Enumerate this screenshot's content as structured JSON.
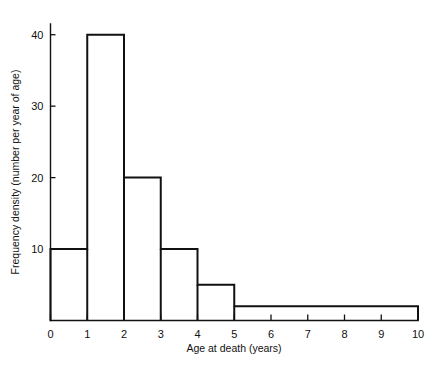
{
  "figure": {
    "title": "",
    "background_color": "#ffffff",
    "line_color": "#111111"
  },
  "axes": {
    "x": {
      "label": "Age at death (years)",
      "ticks": [
        "0",
        "1",
        "2",
        "3",
        "4",
        "5",
        "6",
        "7",
        "8",
        "9",
        "10"
      ],
      "min": 0,
      "max": 10
    },
    "y": {
      "label": "Frequency density (number per year of age)",
      "ticks": [
        "10",
        "20",
        "30",
        "40"
      ],
      "min": 0,
      "max": 41.5
    }
  },
  "chart_data": {
    "type": "bar",
    "title": "",
    "xlabel": "Age at death (years)",
    "ylabel": "Frequency density (number per year of age)",
    "xlim": [
      0,
      10
    ],
    "ylim": [
      0,
      41.5
    ],
    "xticks": [
      0,
      1,
      2,
      3,
      4,
      5,
      6,
      7,
      8,
      9,
      10
    ],
    "yticks": [
      10,
      20,
      30,
      40
    ],
    "grid": false,
    "legend": null,
    "style": "histogram-outline",
    "bins": [
      {
        "label": "0-1",
        "start": 0,
        "end": 1,
        "value": 10
      },
      {
        "label": "1-2",
        "start": 1,
        "end": 2,
        "value": 40
      },
      {
        "label": "2-3",
        "start": 2,
        "end": 3,
        "value": 20
      },
      {
        "label": "3-4",
        "start": 3,
        "end": 4,
        "value": 10
      },
      {
        "label": "4-5",
        "start": 4,
        "end": 5,
        "value": 5
      },
      {
        "label": "5-10",
        "start": 5,
        "end": 10,
        "value": 2
      }
    ],
    "categories": [
      "0-1",
      "1-2",
      "2-3",
      "3-4",
      "4-5",
      "5-10"
    ],
    "values": [
      10,
      40,
      20,
      10,
      5,
      2
    ]
  }
}
